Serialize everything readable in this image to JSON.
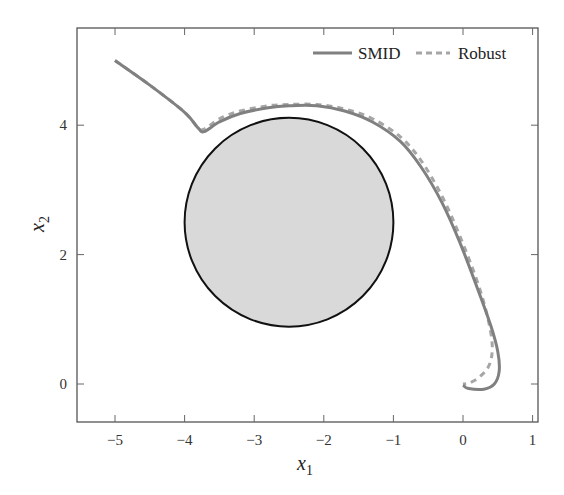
{
  "chart_data": {
    "type": "line",
    "title": "",
    "xlabel": "x_1",
    "ylabel": "x_2",
    "xlim": [
      -5.55,
      1.07
    ],
    "ylim": [
      -0.58,
      5.5
    ],
    "grid": false,
    "legend_position": "top-right",
    "xticks": [
      -5,
      -4,
      -3,
      -2,
      -1,
      0,
      1
    ],
    "yticks": [
      0,
      2,
      4
    ],
    "obstacle": {
      "shape": "circle",
      "center": [
        -2.5,
        2.5
      ],
      "radius": 1.5,
      "fill": "#d9d9d9",
      "stroke": "#111111"
    },
    "series": [
      {
        "name": "SMID",
        "style": "solid",
        "color": "#808080",
        "points": [
          [
            -5,
            5
          ],
          [
            -4.5,
            4.62
          ],
          [
            -4,
            4.2
          ],
          [
            -3.8,
            3.95
          ],
          [
            -3.72,
            3.9
          ],
          [
            -3.5,
            4.05
          ],
          [
            -3.2,
            4.18
          ],
          [
            -2.8,
            4.27
          ],
          [
            -2.5,
            4.3
          ],
          [
            -2.1,
            4.3
          ],
          [
            -1.7,
            4.22
          ],
          [
            -1.3,
            4.05
          ],
          [
            -0.9,
            3.75
          ],
          [
            -0.6,
            3.35
          ],
          [
            -0.3,
            2.8
          ],
          [
            -0.05,
            2.2
          ],
          [
            0.2,
            1.5
          ],
          [
            0.4,
            0.9
          ],
          [
            0.5,
            0.5
          ],
          [
            0.52,
            0.2
          ],
          [
            0.45,
            0.0
          ],
          [
            0.3,
            -0.08
          ],
          [
            0.08,
            -0.07
          ],
          [
            0,
            -0.02
          ]
        ]
      },
      {
        "name": "Robust",
        "style": "dashed",
        "color": "#a6a6a6",
        "points": [
          [
            -5,
            5
          ],
          [
            -4.5,
            4.62
          ],
          [
            -4,
            4.2
          ],
          [
            -3.8,
            3.95
          ],
          [
            -3.7,
            3.95
          ],
          [
            -3.5,
            4.1
          ],
          [
            -3.2,
            4.22
          ],
          [
            -2.8,
            4.3
          ],
          [
            -2.5,
            4.32
          ],
          [
            -2.1,
            4.32
          ],
          [
            -1.7,
            4.25
          ],
          [
            -1.3,
            4.1
          ],
          [
            -0.9,
            3.82
          ],
          [
            -0.6,
            3.45
          ],
          [
            -0.3,
            2.9
          ],
          [
            -0.05,
            2.3
          ],
          [
            0.2,
            1.6
          ],
          [
            0.35,
            1.05
          ],
          [
            0.42,
            0.6
          ],
          [
            0.38,
            0.3
          ],
          [
            0.25,
            0.12
          ],
          [
            0.1,
            0.02
          ],
          [
            0,
            0
          ]
        ]
      }
    ]
  },
  "legend": {
    "items": [
      {
        "label": "SMID"
      },
      {
        "label": "Robust"
      }
    ]
  },
  "axes": {
    "xlabel_main": "x",
    "xlabel_sub": "1",
    "ylabel_main": "x",
    "ylabel_sub": "2",
    "xtick_labels": [
      "−5",
      "−4",
      "−3",
      "−2",
      "−1",
      "0",
      "1"
    ],
    "ytick_labels": [
      "0",
      "2",
      "4"
    ]
  }
}
